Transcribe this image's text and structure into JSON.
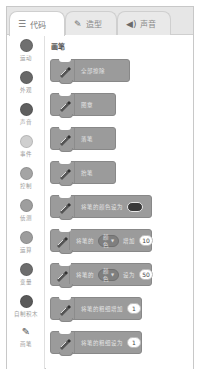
{
  "tabs": [
    {
      "label": "代码",
      "icon": "code-icon",
      "active": true
    },
    {
      "label": "造型",
      "icon": "brush-icon",
      "active": false
    },
    {
      "label": "声音",
      "icon": "speaker-icon",
      "active": false
    }
  ],
  "categories": [
    {
      "label": "运动",
      "color": "#6f6f6f"
    },
    {
      "label": "外观",
      "color": "#686868"
    },
    {
      "label": "声音",
      "color": "#5f5f5f"
    },
    {
      "label": "事件",
      "color": "#cfcfcf"
    },
    {
      "label": "控制",
      "color": "#a4a4a4"
    },
    {
      "label": "侦测",
      "color": "#9e9e9e"
    },
    {
      "label": "运算",
      "color": "#9d9d9d"
    },
    {
      "label": "变量",
      "color": "#6d6d6d"
    },
    {
      "label": "自制积木",
      "color": "#5a5a5a"
    },
    {
      "label": "画笔",
      "icon": "pen-icon"
    }
  ],
  "palette": {
    "section_title": "画笔",
    "blocks": [
      {
        "text": "全部擦除"
      },
      {
        "text": "图章"
      },
      {
        "text": "落笔"
      },
      {
        "text": "抬笔"
      },
      {
        "text": "将笔的颜色设为",
        "swatch": "#3a3a3a"
      },
      {
        "pre": "将笔的",
        "dropdown": "颜色",
        "post": "增加",
        "value": "10"
      },
      {
        "pre": "将笔的",
        "dropdown": "颜色",
        "post": "设为",
        "value": "50"
      },
      {
        "text": "将笔的粗细增加",
        "value": "1"
      },
      {
        "text": "将笔的粗细设为",
        "value": "1"
      }
    ]
  }
}
